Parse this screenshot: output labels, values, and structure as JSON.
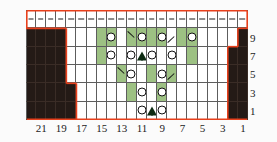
{
  "chart_data": {
    "type": "table",
    "xlabel": "Stitch number",
    "ylabel": "Row number",
    "columns": 22,
    "rows": 6,
    "grid_on": true,
    "legend_position": "none",
    "column_labels": [
      "21",
      "19",
      "17",
      "15",
      "13",
      "11",
      "9",
      "7",
      "5",
      "3",
      "1"
    ],
    "column_label_positions": [
      21,
      19,
      17,
      15,
      13,
      11,
      9,
      7,
      5,
      3,
      1
    ],
    "row_labels": [
      "9",
      "7",
      "5",
      "3",
      "1"
    ],
    "row_label_rows": [
      9,
      7,
      5,
      3,
      1
    ],
    "colors": {
      "highlight": "#9dc183",
      "no_stitch": "#241a16",
      "outline": "#e8401c",
      "grid": "#5d5d5d",
      "background": "#ffffff"
    },
    "symbol_legend": {
      "dash": "purl",
      "yo": "yarn-over",
      "dec-l": "left-leaning-decrease",
      "dec-r": "right-leaning-decrease",
      "peak": "central-double-decrease",
      "green": "highlight-cell",
      "dark": "no-stitch"
    },
    "cells": [
      {
        "row": 0,
        "label": "top",
        "values": [
          {
            "c": 1,
            "s": "dash"
          },
          {
            "c": 2,
            "s": "dash"
          },
          {
            "c": 3,
            "s": "dash"
          },
          {
            "c": 4,
            "s": "dash"
          },
          {
            "c": 5,
            "s": "dash"
          },
          {
            "c": 6,
            "s": "dash"
          },
          {
            "c": 7,
            "s": "dash"
          },
          {
            "c": 8,
            "s": "dash"
          },
          {
            "c": 9,
            "s": "dash"
          },
          {
            "c": 10,
            "s": "dash"
          },
          {
            "c": 11,
            "s": "dash"
          },
          {
            "c": 12,
            "s": "dash"
          },
          {
            "c": 13,
            "s": "dash"
          },
          {
            "c": 14,
            "s": "dash"
          },
          {
            "c": 15,
            "s": "dash"
          },
          {
            "c": 16,
            "s": "dash"
          },
          {
            "c": 17,
            "s": "dash"
          },
          {
            "c": 18,
            "s": "dash"
          },
          {
            "c": 19,
            "s": "dash"
          },
          {
            "c": 20,
            "s": "dash"
          },
          {
            "c": 21,
            "s": "dash"
          },
          {
            "c": 22,
            "s": "dash"
          }
        ]
      },
      {
        "row": 9,
        "label": "9",
        "green": [
          8,
          9,
          11,
          12,
          13,
          14,
          16,
          17
        ],
        "values": [
          {
            "c": 9,
            "s": "yo"
          },
          {
            "c": 11,
            "s": "dec-l"
          },
          {
            "c": 12,
            "s": "yo"
          },
          {
            "c": 14,
            "s": "yo"
          },
          {
            "c": 15,
            "s": "dec-r"
          },
          {
            "c": 17,
            "s": "yo"
          }
        ],
        "dark": [
          1,
          2,
          3,
          4,
          22
        ]
      },
      {
        "row": 7,
        "label": "7",
        "green": [
          8,
          17
        ],
        "values": [
          {
            "c": 9,
            "s": "yo"
          },
          {
            "c": 11,
            "s": "yo"
          },
          {
            "c": 12,
            "s": "peak"
          },
          {
            "c": 13,
            "s": "yo"
          },
          {
            "c": 15,
            "s": "yo"
          }
        ],
        "dark": [
          1,
          2,
          3,
          4,
          21,
          22
        ]
      },
      {
        "row": 5,
        "label": "5",
        "green": [
          10,
          13,
          15
        ],
        "values": [
          {
            "c": 10,
            "s": "dec-l"
          },
          {
            "c": 11,
            "s": "yo"
          },
          {
            "c": 14,
            "s": "yo"
          },
          {
            "c": 15,
            "s": "dec-r"
          }
        ],
        "dark": [
          1,
          2,
          3,
          4,
          21,
          22
        ]
      },
      {
        "row": 3,
        "label": "3",
        "green": [
          11,
          14
        ],
        "values": [
          {
            "c": 12,
            "s": "yo"
          },
          {
            "c": 14,
            "s": "yo"
          }
        ],
        "dark": [
          1,
          2,
          3,
          4,
          5,
          21,
          22
        ]
      },
      {
        "row": 1,
        "label": "1",
        "green": [],
        "values": [
          {
            "c": 12,
            "s": "yo"
          },
          {
            "c": 13,
            "s": "peak"
          },
          {
            "c": 14,
            "s": "yo"
          }
        ],
        "dark": [
          1,
          2,
          3,
          4,
          5,
          21,
          22
        ]
      }
    ]
  }
}
